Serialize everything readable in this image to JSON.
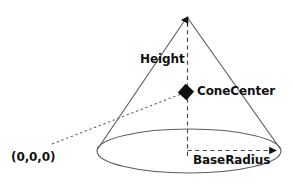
{
  "diagram": {
    "shape": "cone",
    "labels": {
      "height": "Height",
      "cone_center": "ConeCenter",
      "base_radius": "BaseRadius",
      "origin": "(0,0,0)"
    },
    "markers": {
      "cone_center_marker": "diamond-marker",
      "apex_marker": "arrow-up-icon",
      "base_radius_marker": "arrow-right-icon"
    },
    "colors": {
      "stroke": "#5a5a5a",
      "dash": "#4a4a4a",
      "text": "#111111",
      "marker": "#111111",
      "background": "#ffffff"
    },
    "geometry": {
      "apex_x": 187,
      "apex_y": 14,
      "base_center_x": 189,
      "base_center_y": 151,
      "base_radius_x": 92,
      "base_radius_y": 22,
      "cone_center_x": 186,
      "cone_center_y": 92,
      "origin_x": 52,
      "origin_y": 143
    }
  }
}
